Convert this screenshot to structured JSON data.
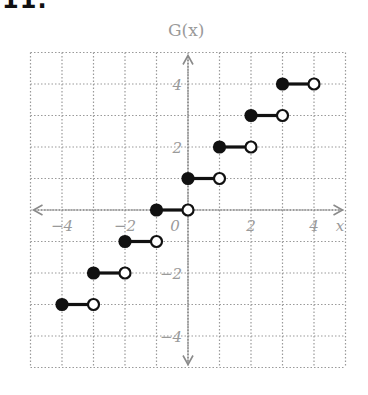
{
  "problem": {
    "number": "11."
  },
  "chart_data": {
    "type": "step",
    "title": "",
    "ylabel": "G(x)",
    "xlabel": "x",
    "xlim": [
      -5,
      5
    ],
    "ylim": [
      -5,
      5
    ],
    "grid": true,
    "x_ticks": [
      -4,
      -2,
      0,
      2,
      4
    ],
    "x_tick_labels": [
      "−4",
      "−2",
      "0",
      "2",
      "4"
    ],
    "y_ticks": [
      4,
      2,
      -2,
      -4
    ],
    "y_tick_labels": [
      "4",
      "2",
      "−2",
      "−4"
    ],
    "segments": [
      {
        "x_start": -4,
        "x_end": -3,
        "y": -3,
        "start": "closed",
        "end": "open"
      },
      {
        "x_start": -3,
        "x_end": -2,
        "y": -2,
        "start": "closed",
        "end": "open"
      },
      {
        "x_start": -2,
        "x_end": -1,
        "y": -1,
        "start": "closed",
        "end": "open"
      },
      {
        "x_start": -1,
        "x_end": 0,
        "y": 0,
        "start": "closed",
        "end": "open"
      },
      {
        "x_start": 0,
        "x_end": 1,
        "y": 1,
        "start": "closed",
        "end": "open"
      },
      {
        "x_start": 1,
        "x_end": 2,
        "y": 2,
        "start": "closed",
        "end": "open"
      },
      {
        "x_start": 2,
        "x_end": 3,
        "y": 3,
        "start": "closed",
        "end": "open"
      },
      {
        "x_start": 3,
        "x_end": 4,
        "y": 4,
        "start": "closed",
        "end": "open"
      }
    ],
    "colors": {
      "grid": "#9a9a9a",
      "axis": "#8a8a8a",
      "segment": "#111111",
      "label": "#9a9a9a"
    }
  }
}
